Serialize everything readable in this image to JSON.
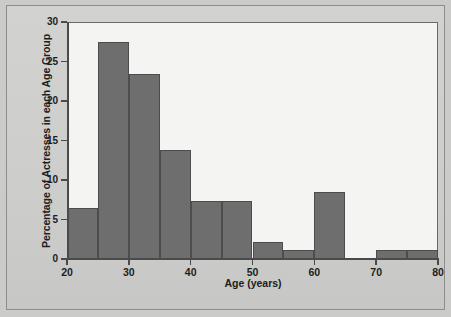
{
  "chart_data": {
    "type": "bar",
    "title": "",
    "subtitle": "",
    "xlabel": "Age (years)",
    "ylabel": "Percentage of Actresses in each Age Group",
    "xlim": [
      20,
      80
    ],
    "ylim": [
      0,
      30
    ],
    "bin_width": 5,
    "grid": false,
    "legend": null,
    "bar_color": "#6e6e6e",
    "bar_edge_color": "#4d4d4d",
    "plot_background": "#f4f4f2",
    "figure_background": "#cbcbc9",
    "axis_color": "#4a4a4a",
    "xticks": [
      20,
      30,
      40,
      50,
      60,
      70,
      80
    ],
    "xtick_labels": [
      "20",
      "30",
      "40",
      "50",
      "60",
      "70",
      "80"
    ],
    "yticks": [
      0,
      5,
      10,
      15,
      20,
      25,
      30
    ],
    "ytick_labels": [
      "0",
      "5",
      "10",
      "15",
      "20",
      "25",
      "30"
    ],
    "bins": [
      {
        "start": 20,
        "end": 25,
        "value": 6.4
      },
      {
        "start": 25,
        "end": 30,
        "value": 27.5
      },
      {
        "start": 30,
        "end": 35,
        "value": 23.4
      },
      {
        "start": 35,
        "end": 40,
        "value": 13.8
      },
      {
        "start": 40,
        "end": 45,
        "value": 7.4
      },
      {
        "start": 45,
        "end": 50,
        "value": 7.4
      },
      {
        "start": 50,
        "end": 55,
        "value": 2.1
      },
      {
        "start": 55,
        "end": 60,
        "value": 1.1
      },
      {
        "start": 60,
        "end": 65,
        "value": 8.5
      },
      {
        "start": 65,
        "end": 70,
        "value": 0
      },
      {
        "start": 70,
        "end": 75,
        "value": 1.1
      },
      {
        "start": 75,
        "end": 80,
        "value": 1.1
      }
    ],
    "categories": [
      "20-25",
      "25-30",
      "30-35",
      "35-40",
      "40-45",
      "45-50",
      "50-55",
      "55-60",
      "60-65",
      "65-70",
      "70-75",
      "75-80"
    ],
    "values": [
      6.4,
      27.5,
      23.4,
      13.8,
      7.4,
      7.4,
      2.1,
      1.1,
      8.5,
      0,
      1.1,
      1.1
    ]
  }
}
